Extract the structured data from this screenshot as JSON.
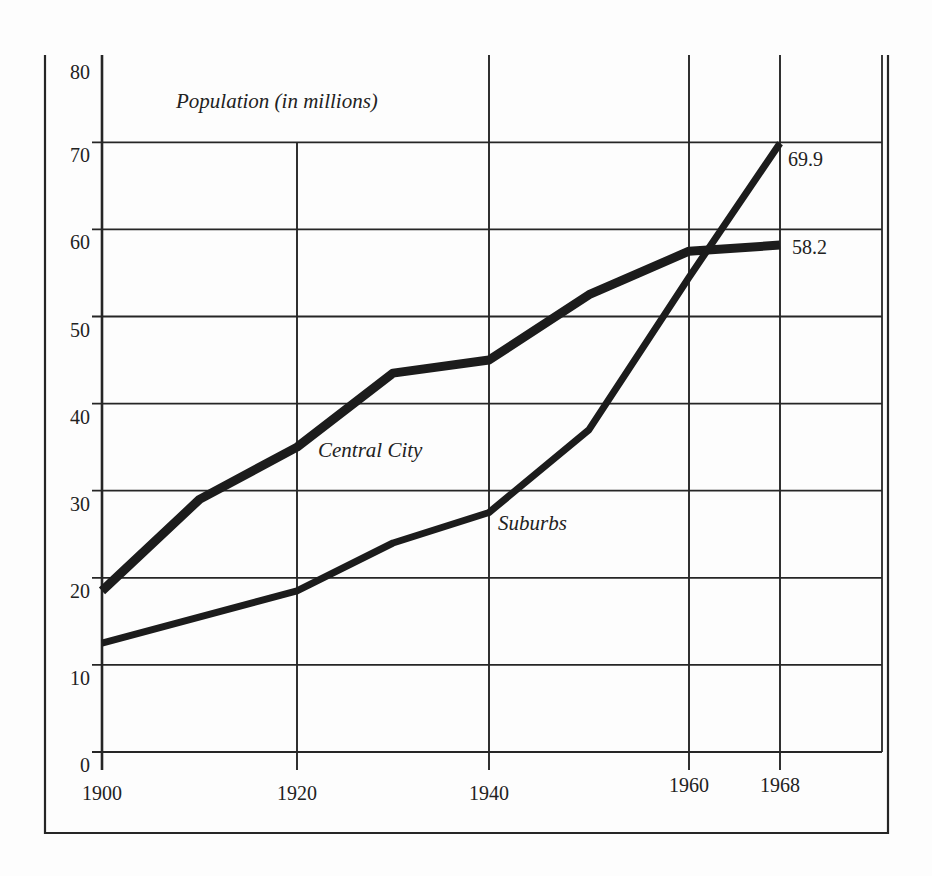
{
  "chart_data": {
    "type": "line",
    "title": "Population (in millions)",
    "xlabel": "",
    "ylabel": "Population (in millions)",
    "x": [
      1900,
      1910,
      1920,
      1930,
      1940,
      1950,
      1960,
      1968
    ],
    "x_ticks": [
      "1900",
      "1920",
      "1940",
      "1960",
      "1968"
    ],
    "y_ticks": [
      "0",
      "10",
      "20",
      "30",
      "40",
      "50",
      "60",
      "70",
      "80"
    ],
    "ylim": [
      0,
      80
    ],
    "xlim": [
      1900,
      1978
    ],
    "grid": true,
    "legend": "inline labels",
    "series": [
      {
        "name": "Central City",
        "x": [
          1900,
          1910,
          1920,
          1930,
          1940,
          1950,
          1953,
          1960,
          1968
        ],
        "values": [
          18.5,
          29,
          35,
          43.5,
          45,
          52.5,
          54,
          57.5,
          58.2
        ],
        "end_label": "58.2"
      },
      {
        "name": "Suburbs",
        "x": [
          1900,
          1920,
          1930,
          1940,
          1950,
          1960,
          1968
        ],
        "values": [
          12.5,
          18.5,
          24,
          27.5,
          37,
          54.5,
          69.9
        ],
        "end_label": "69.9"
      }
    ],
    "annotations": [
      "Central City",
      "Suburbs",
      "69.9",
      "58.2"
    ]
  },
  "labels": {
    "title": "Population (in millions)",
    "central_city": "Central City",
    "suburbs": "Suburbs",
    "central_end": "58.2",
    "suburbs_end": "69.9"
  }
}
